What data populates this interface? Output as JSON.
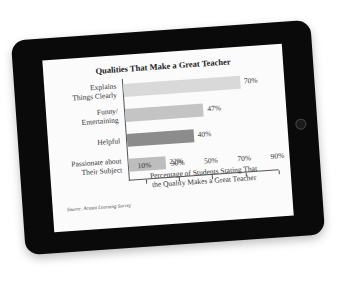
{
  "chart_data": {
    "type": "bar",
    "orientation": "horizontal",
    "title": "Qualities That Make a Great Teacher",
    "categories": [
      "Explains Things Clearly",
      "Funny/ Entertaining",
      "Helpful",
      "Passionate about Their Subject"
    ],
    "category_lines": [
      [
        "Explains",
        "Things Clearly"
      ],
      [
        "Funny/",
        "Entertaining"
      ],
      [
        "Helpful"
      ],
      [
        "Passionate about",
        "Their Subject"
      ]
    ],
    "values": [
      70,
      47,
      40,
      22
    ],
    "value_labels": [
      "70%",
      "47%",
      "40%",
      "22%"
    ],
    "bar_colors": [
      "#d9d9d9",
      "#c4c4c4",
      "#8c8c8c",
      "#bdbdbd"
    ],
    "xlabel": "Percentage of Students Stating That the Quality Makes a Great Teacher",
    "xlabel_lines": [
      "Percentage of Students Stating That",
      "the Quality Makes a Great Teacher"
    ],
    "ylabel": "",
    "xticks": [
      10,
      30,
      50,
      70,
      90
    ],
    "xtick_labels": [
      "10%",
      "30%",
      "50%",
      "70%",
      "90%"
    ],
    "xlim": [
      0,
      90
    ],
    "grid": false,
    "legend": null,
    "source": "Source: Acosta Learning Survey"
  },
  "device": {
    "frame_color": "#0a0a0a",
    "screen_color": "#fbfbfb",
    "home_button": "home-button"
  }
}
